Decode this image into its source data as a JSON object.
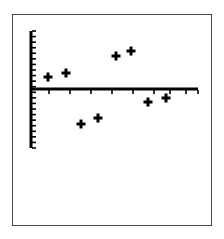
{
  "figure": {
    "frame": {
      "x": 12,
      "y": 14,
      "width": 200,
      "height": 212,
      "border_color": "#4a4a52"
    },
    "background_color": "#ffffff",
    "ink_color": "#000000"
  },
  "chart_data": {
    "type": "scatter",
    "title": "",
    "subtitle": "",
    "xlabel": "",
    "ylabel": "",
    "grid": false,
    "legend": null,
    "marker": "plus",
    "marker_size_px": 9,
    "marker_color": "#000000",
    "axes": {
      "x_axis": {
        "visible": true,
        "orientation": "horizontal",
        "pixel_y": 89,
        "pixel_x_start": 31,
        "pixel_x_end": 198,
        "line_width_px": 3,
        "tick_count": 9,
        "tick_length_px": 4,
        "tick_direction": "down",
        "tick_pixel_positions": [
          49,
          70,
          91,
          112,
          133,
          154,
          170,
          186,
          198
        ],
        "tick_labels": [],
        "xlim": [
          0,
          9
        ]
      },
      "y_axis": {
        "visible": true,
        "orientation": "vertical",
        "pixel_x": 31,
        "pixel_y_start": 31,
        "pixel_y_end": 148,
        "line_width_px": 3,
        "tick_count": 22,
        "tick_length_px": 4,
        "tick_direction": "right",
        "tick_labels": [],
        "ylim": [
          -5,
          6
        ]
      }
    },
    "points": [
      {
        "label": "p1",
        "px": 48,
        "py": 77,
        "x": 1,
        "y": 0.6
      },
      {
        "label": "p2",
        "px": 66,
        "py": 73,
        "x": 2,
        "y": 0.8
      },
      {
        "label": "p3",
        "px": 81,
        "py": 124,
        "x": 3,
        "y": -1.7
      },
      {
        "label": "p4",
        "px": 98,
        "py": 118,
        "x": 4,
        "y": -1.4
      },
      {
        "label": "p5",
        "px": 116,
        "py": 56,
        "x": 5,
        "y": 1.6
      },
      {
        "label": "p6",
        "px": 131,
        "py": 51,
        "x": 6,
        "y": 1.8
      },
      {
        "label": "p7",
        "px": 148,
        "py": 102,
        "x": 7,
        "y": -0.6
      },
      {
        "label": "p8",
        "px": 166,
        "py": 98,
        "x": 8,
        "y": -0.4
      }
    ],
    "x": [
      1,
      2,
      3,
      4,
      5,
      6,
      7,
      8
    ],
    "values": [
      0.6,
      0.8,
      -1.7,
      -1.4,
      1.6,
      1.8,
      -0.6,
      -0.4
    ],
    "annotations": []
  }
}
